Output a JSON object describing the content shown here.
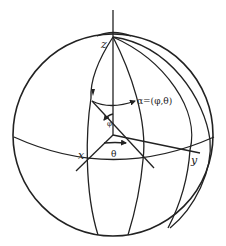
{
  "figure": {
    "type": "spherical-coordinates-diagram",
    "labels": {
      "z_axis": "z",
      "x_axis": "x",
      "y_axis": "y",
      "direction": "α=(φ,θ)",
      "polar_angle": "φ",
      "azimuth_angle": "θ"
    },
    "colors": {
      "stroke": "#222222",
      "background": "#ffffff"
    }
  }
}
